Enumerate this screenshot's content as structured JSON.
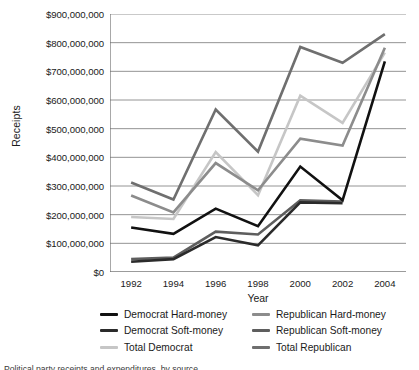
{
  "chart_data": {
    "type": "line",
    "title": "",
    "xlabel": "Year",
    "ylabel": "Receipts",
    "categories": [
      "1992",
      "1994",
      "1996",
      "1998",
      "2000",
      "2002",
      "2004"
    ],
    "ylim": [
      0,
      900000000
    ],
    "ytick_values": [
      0,
      100000000,
      200000000,
      300000000,
      400000000,
      500000000,
      600000000,
      700000000,
      800000000,
      900000000
    ],
    "ytick_labels": [
      "$0",
      "$100,000,000",
      "$200,000,000",
      "$300,000,000",
      "$400,000,000",
      "$500,000,000",
      "$600,000,000",
      "$700,000,000",
      "$800,000,000",
      "$900,000,000"
    ],
    "grid": true,
    "legend_position": "below",
    "series": [
      {
        "name": "Democrat Hard-money",
        "color": "#111111",
        "values": [
          155000000,
          133000000,
          221000000,
          160000000,
          368000000,
          250000000,
          735000000
        ]
      },
      {
        "name": "Democrat Soft-money",
        "color": "#2b2b2b",
        "values": [
          36000000,
          45000000,
          122000000,
          93000000,
          243000000,
          240000000,
          0
        ]
      },
      {
        "name": "Total Democrat",
        "color": "#c6c6c6",
        "values": [
          192000000,
          185000000,
          418000000,
          268000000,
          615000000,
          520000000,
          765000000
        ]
      },
      {
        "name": "Republican Hard-money",
        "color": "#8c8c8c",
        "values": [
          267000000,
          208000000,
          380000000,
          285000000,
          465000000,
          441000000,
          782000000
        ]
      },
      {
        "name": "Republican Soft-money",
        "color": "#5e5e5e",
        "values": [
          45000000,
          50000000,
          141000000,
          131000000,
          250000000,
          246000000,
          0
        ]
      },
      {
        "name": "Total Republican",
        "color": "#6f6f6f",
        "values": [
          312000000,
          253000000,
          567000000,
          420000000,
          785000000,
          730000000,
          830000000
        ]
      }
    ]
  },
  "legend": {
    "items": [
      {
        "label": "Democrat Hard-money",
        "color": "#111111",
        "swatch": "line-swatch"
      },
      {
        "label": "Republican Hard-money",
        "color": "#8c8c8c",
        "swatch": "line-swatch"
      },
      {
        "label": "Democrat Soft-money",
        "color": "#2b2b2b",
        "swatch": "line-swatch"
      },
      {
        "label": "Republican Soft-money",
        "color": "#5e5e5e",
        "swatch": "line-swatch"
      },
      {
        "label": "Total Democrat",
        "color": "#c6c6c6",
        "swatch": "line-swatch"
      },
      {
        "label": "Total Republican",
        "color": "#6f6f6f",
        "swatch": "line-swatch"
      }
    ]
  },
  "caption": {
    "text": "Political party receipts and expenditures, by source"
  },
  "colors": {
    "axis": "#6d6d6d",
    "grid": "#888888",
    "text": "#1a1a1a",
    "background": "#ffffff"
  }
}
